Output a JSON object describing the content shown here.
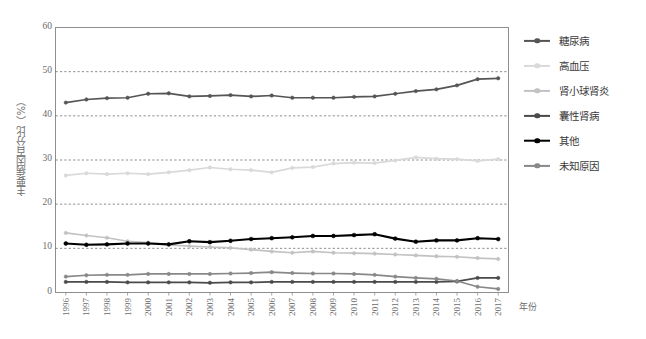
{
  "chart_data": {
    "type": "line",
    "title": "",
    "xlabel": "年份",
    "ylabel": "主要病因百分比（%）",
    "ylim": [
      0,
      60
    ],
    "ytick_step": 10,
    "yticks": [
      0,
      10,
      20,
      30,
      40,
      50,
      60
    ],
    "grid": true,
    "grid_style": "dashed-horizontal",
    "legend_position": "right",
    "categories": [
      "1996",
      "1997",
      "1998",
      "1999",
      "2000",
      "2001",
      "2002",
      "2003",
      "2004",
      "2005",
      "2006",
      "2007",
      "2008",
      "2009",
      "2010",
      "2011",
      "2012",
      "2013",
      "2014",
      "2015",
      "2016",
      "2017"
    ],
    "series": [
      {
        "name": "糖尿病",
        "color": "#555555",
        "values": [
          43.0,
          43.7,
          44.0,
          44.1,
          45.0,
          45.1,
          44.4,
          44.5,
          44.7,
          44.4,
          44.6,
          44.1,
          44.1,
          44.1,
          44.3,
          44.4,
          45.0,
          45.6,
          46.0,
          46.9,
          48.3,
          48.5
        ]
      },
      {
        "name": "高血压",
        "color": "#d9d9d9",
        "values": [
          26.5,
          27.0,
          26.8,
          27.0,
          26.8,
          27.2,
          27.7,
          28.3,
          27.9,
          27.7,
          27.2,
          28.2,
          28.4,
          29.2,
          29.4,
          29.3,
          29.9,
          30.6,
          30.3,
          30.2,
          29.8,
          30.2
        ]
      },
      {
        "name": "肾小球肾炎",
        "color": "#c2c2c2",
        "values": [
          13.5,
          12.9,
          12.4,
          11.6,
          11.3,
          10.8,
          10.5,
          10.3,
          10.1,
          9.7,
          9.3,
          9.0,
          9.3,
          9.0,
          8.9,
          8.8,
          8.6,
          8.4,
          8.2,
          8.1,
          7.8,
          7.6
        ]
      },
      {
        "name": "囊性肾病",
        "color": "#4a4a4a",
        "values": [
          2.4,
          2.4,
          2.4,
          2.3,
          2.3,
          2.3,
          2.3,
          2.2,
          2.3,
          2.3,
          2.4,
          2.4,
          2.4,
          2.4,
          2.4,
          2.4,
          2.4,
          2.4,
          2.4,
          2.5,
          3.3,
          3.3
        ]
      },
      {
        "name": "其他",
        "color": "#000000",
        "values": [
          11.1,
          10.8,
          10.9,
          11.1,
          11.1,
          10.9,
          11.6,
          11.4,
          11.7,
          12.1,
          12.3,
          12.5,
          12.8,
          12.8,
          13.0,
          13.2,
          12.2,
          11.5,
          11.8,
          11.8,
          12.3,
          12.1
        ]
      },
      {
        "name": "未知原因",
        "color": "#888888",
        "values": [
          3.6,
          3.9,
          4.0,
          4.0,
          4.2,
          4.2,
          4.2,
          4.2,
          4.3,
          4.4,
          4.6,
          4.4,
          4.3,
          4.3,
          4.2,
          4.0,
          3.6,
          3.3,
          3.1,
          2.6,
          1.3,
          0.8
        ]
      }
    ]
  }
}
